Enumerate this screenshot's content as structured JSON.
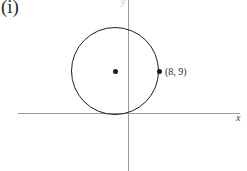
{
  "figure": {
    "part_label": "(i)",
    "background_color": "#ffffff",
    "width": 247,
    "height": 171
  },
  "axes": {
    "x_label": "x",
    "y_label": "y",
    "axis_color": "#9a9a9a",
    "origin": {
      "x": 128,
      "y": 113
    },
    "x_axis": {
      "start_x": 18,
      "end_x": 240,
      "y": 113
    },
    "y_axis": {
      "x": 128,
      "start_y": 0,
      "end_y": 171
    }
  },
  "chart_data": {
    "type": "scatter",
    "title": "(i)",
    "xlabel": "x",
    "ylabel": "y",
    "grid": false,
    "legend": null,
    "shapes": [
      {
        "kind": "circle",
        "center_px": {
          "x": 115,
          "y": 71
        },
        "radius_px": 44,
        "stroke": "#1e1e1e",
        "stroke_width": 1.6,
        "fill": "none",
        "tangent_to": "x-axis"
      }
    ],
    "points": [
      {
        "name": "center",
        "px": {
          "x": 115,
          "y": 71
        },
        "label": "",
        "marker": "filled-dot"
      },
      {
        "name": "point-on-circle",
        "px": {
          "x": 159,
          "y": 71
        },
        "label": "(8, 9)",
        "marker": "filled-dot"
      }
    ],
    "annotations": [
      {
        "text": "(8, 9)",
        "px": {
          "x": 165,
          "y": 66
        }
      },
      {
        "text": "x",
        "px": {
          "x": 236,
          "y": 112
        }
      },
      {
        "text": "y",
        "px": {
          "x": 121,
          "y": -4
        }
      },
      {
        "text": "(i)",
        "px": {
          "x": 1,
          "y": -3
        }
      }
    ]
  }
}
